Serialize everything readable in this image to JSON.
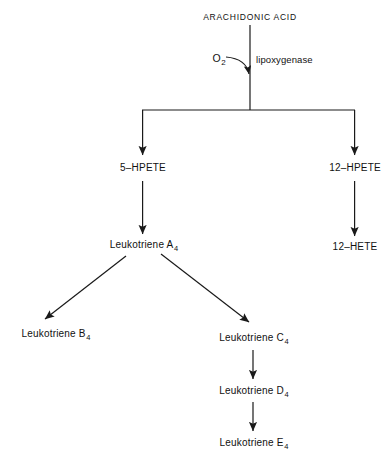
{
  "diagram": {
    "background_color": "#ffffff",
    "line_color": "#1a1a1a"
  },
  "nodes": {
    "arachidonic_acid": "ARACHIDONIC ACID",
    "hpete_5": "5–HPETE",
    "hpete_12": "12–HPETE",
    "hete_12": "12–HETE",
    "leukotriene_a": {
      "name": "Leukotriene A",
      "subscript": "4"
    },
    "leukotriene_b": {
      "name": "Leukotriene B",
      "subscript": "4"
    },
    "leukotriene_c": {
      "name": "Leukotriene C",
      "subscript": "4"
    },
    "leukotriene_d": {
      "name": "Leukotriene D",
      "subscript": "4"
    },
    "leukotriene_e": {
      "name": "Leukotriene E",
      "subscript": "4"
    }
  },
  "reaction": {
    "substrate": {
      "name": "O",
      "subscript": "2"
    },
    "enzyme": "lipoxygenase"
  }
}
